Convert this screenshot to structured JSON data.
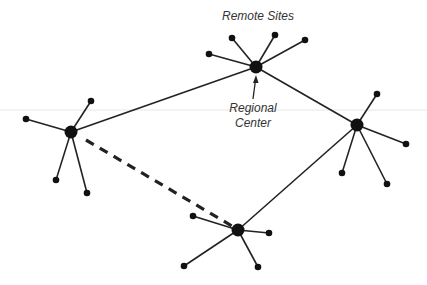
{
  "labels": {
    "remote_sites": "Remote Sites",
    "regional_center_line1": "Regional",
    "regional_center_line2": "Center"
  },
  "colors": {
    "line": "#222222",
    "node": "#111111",
    "text": "#333333",
    "guide": "#e4e4e4"
  },
  "hubs": [
    {
      "id": "top",
      "x": 256,
      "y": 67,
      "leaves": [
        [
          209,
          54
        ],
        [
          232,
          38
        ],
        [
          275,
          35
        ],
        [
          305,
          40
        ]
      ]
    },
    {
      "id": "left",
      "x": 71,
      "y": 132,
      "leaves": [
        [
          26,
          119
        ],
        [
          91,
          101
        ],
        [
          56,
          180
        ],
        [
          87,
          193
        ]
      ]
    },
    {
      "id": "right",
      "x": 357,
      "y": 125,
      "leaves": [
        [
          377,
          94
        ],
        [
          406,
          144
        ],
        [
          342,
          173
        ],
        [
          387,
          184
        ]
      ]
    },
    {
      "id": "bottom",
      "x": 238,
      "y": 230,
      "leaves": [
        [
          193,
          216
        ],
        [
          269,
          233
        ],
        [
          184,
          266
        ],
        [
          258,
          267
        ]
      ]
    }
  ],
  "links": [
    {
      "from": "left",
      "to": "top",
      "style": "solid"
    },
    {
      "from": "top",
      "to": "right",
      "style": "solid"
    },
    {
      "from": "right",
      "to": "bottom",
      "style": "solid"
    },
    {
      "from": "left",
      "to": "bottom",
      "style": "dashed"
    }
  ]
}
